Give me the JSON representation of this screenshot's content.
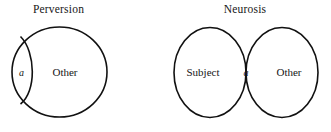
{
  "figure": {
    "background_color": "#ffffff",
    "stroke_color": "#111111",
    "text_color": "#161616"
  },
  "panels": [
    {
      "id": "perversion",
      "title": "Perversion",
      "diagram_type": "single-circle-with-internal-arc",
      "regions": [
        {
          "id": "object-a",
          "label": "a",
          "style": "italic",
          "position": "left-crescent"
        },
        {
          "id": "other",
          "label": "Other",
          "style": "roman",
          "position": "main-body"
        }
      ]
    },
    {
      "id": "neurosis",
      "title": "Neurosis",
      "diagram_type": "two-overlapping-circles",
      "regions": [
        {
          "id": "subject",
          "label": "Subject",
          "style": "roman",
          "position": "left-circle"
        },
        {
          "id": "object-a",
          "label": "a",
          "style": "italic",
          "position": "intersection-lens"
        },
        {
          "id": "other",
          "label": "Other",
          "style": "roman",
          "position": "right-circle"
        }
      ]
    }
  ]
}
